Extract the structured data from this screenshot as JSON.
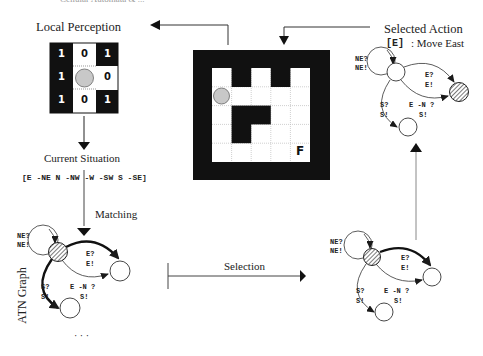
{
  "header": {
    "running_text": "Cellular Automata & ..."
  },
  "local_perception": {
    "title": "Local Perception",
    "cells": [
      [
        "1",
        "0",
        "1"
      ],
      [
        "1",
        "",
        "0"
      ],
      [
        "1",
        "0",
        "1"
      ]
    ],
    "cell_dark": [
      [
        true,
        false,
        true
      ],
      [
        true,
        false,
        false
      ],
      [
        true,
        false,
        true
      ]
    ]
  },
  "current_situation": {
    "title": "Current Situation",
    "vector": "[E -NE N -NW -W -SW S -SE]"
  },
  "flow_labels": {
    "matching": "Matching",
    "selection": "Selection",
    "ellipsis": "· · ·"
  },
  "atn_graph": {
    "label": "ATN Graph",
    "edges": {
      "loop": [
        "NE?",
        "NE!"
      ],
      "east": [
        "E?",
        "E!"
      ],
      "south": [
        "S?",
        "S!"
      ],
      "east_not_north": [
        "E -N ?",
        "S!"
      ]
    }
  },
  "environment": {
    "finish_label": "F",
    "grid_cols": 5,
    "grid_rows": 5,
    "walls": [
      [
        0,
        1
      ],
      [
        0,
        3
      ],
      [
        2,
        1
      ],
      [
        2,
        2
      ],
      [
        3,
        1
      ]
    ],
    "agent_cell": [
      1,
      0
    ]
  },
  "selected_action": {
    "title": "Selected Action",
    "code": "[E]",
    "description": ": Move East"
  },
  "colors": {
    "ink": "#1a1a1a",
    "agent_fill": "#c8c8c8",
    "grid_dots": "#bbbbbb"
  }
}
